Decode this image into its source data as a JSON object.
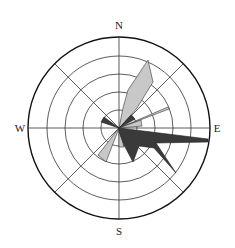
{
  "diagram": {
    "type": "wind-rose",
    "labels": {
      "north": "N",
      "east": "E",
      "south": "S",
      "west": "W"
    },
    "colors": {
      "background": "#ffffff",
      "grid": "#333333",
      "outer_ring": "#111111",
      "light_petal": "#c8c8c8",
      "dark_petal": "#3a3a3a"
    },
    "rings": 4,
    "spokes": [
      "N-S",
      "E-W",
      "NE-SW",
      "NW-SE"
    ],
    "petals": [
      {
        "direction": "NNE",
        "shade": "light",
        "relative_length": 0.76
      },
      {
        "direction": "NE",
        "shade": "dark",
        "relative_length": 0.22
      },
      {
        "direction": "ENE",
        "shade": "light",
        "relative_length": 0.58
      },
      {
        "direction": "E",
        "shade": "light",
        "relative_length": 0.24
      },
      {
        "direction": "E",
        "shade": "dark",
        "relative_length": 0.99
      },
      {
        "direction": "SE",
        "shade": "dark",
        "relative_length": 0.73
      },
      {
        "direction": "SSE",
        "shade": "dark",
        "relative_length": 0.38
      },
      {
        "direction": "S",
        "shade": "light",
        "relative_length": 0.21
      },
      {
        "direction": "SW",
        "shade": "light",
        "relative_length": 0.42
      },
      {
        "direction": "WNW",
        "shade": "dark",
        "relative_length": 0.2
      }
    ]
  }
}
